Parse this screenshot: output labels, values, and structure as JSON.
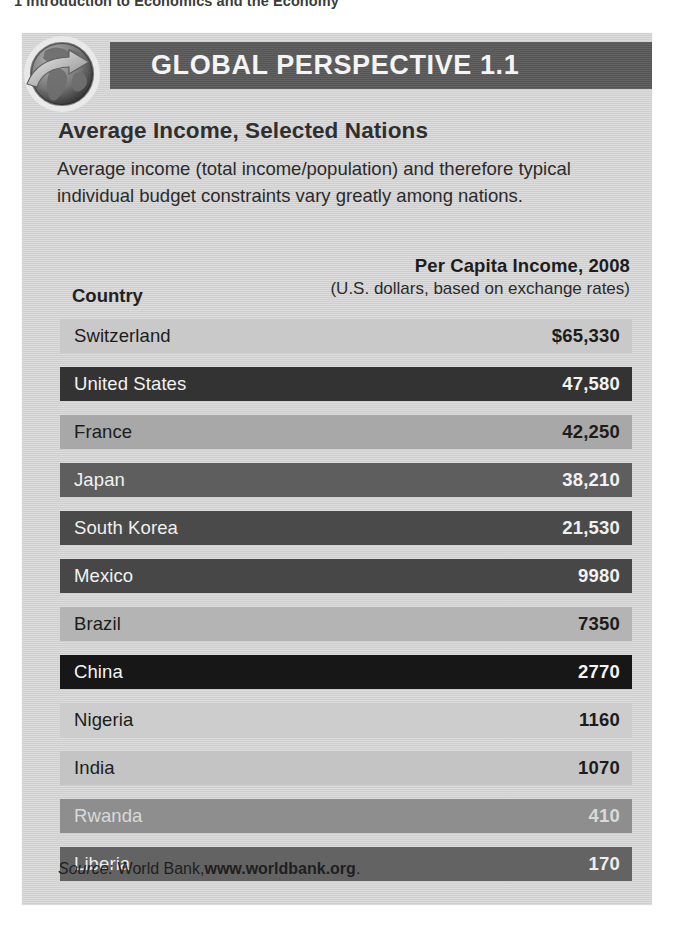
{
  "page": {
    "running_head": "1 Introduction to Economics and the Economy"
  },
  "panel": {
    "band_title": "GLOBAL PERSPECTIVE 1.1",
    "globe_icon": "globe-arrow-icon",
    "headline": "Average Income, Selected Nations",
    "intro": "Average income (total income/population) and therefore typical individual budget constraints vary greatly among nations.",
    "columns": {
      "country": "Country",
      "value_main": "Per Capita Income, 2008",
      "value_sub": "(U.S. dollars, based on exchange rates)"
    },
    "source": {
      "label": "Source:",
      "publisher": "World Bank,",
      "url": "www.worldbank.org",
      "period": "."
    }
  },
  "chart_data": {
    "type": "bar",
    "title": "Average Income, Selected Nations",
    "subtitle": "Per Capita Income, 2008 (U.S. dollars, based on exchange rates)",
    "xlabel": "Country",
    "ylabel": "Per Capita Income, 2008",
    "source": "World Bank, www.worldbank.org",
    "grid": false,
    "legend": "none",
    "orientation": "horizontal",
    "categories": [
      "Switzerland",
      "United States",
      "France",
      "Japan",
      "South Korea",
      "Mexico",
      "Brazil",
      "China",
      "Nigeria",
      "India",
      "Rwanda",
      "Liberia"
    ],
    "values": [
      65330,
      47580,
      42250,
      38210,
      21530,
      9980,
      7350,
      2770,
      1160,
      1070,
      410,
      170
    ],
    "value_labels": [
      "$65,330",
      "47,580",
      "42,250",
      "38,210",
      "21,530",
      "9980",
      "7350",
      "2770",
      "1160",
      "1070",
      "410",
      "170"
    ],
    "rows": [
      {
        "country": "Switzerland",
        "value": 65330,
        "label": "$65,330",
        "bar_color": "#c9c9c9",
        "text_color": "#1c1c1c"
      },
      {
        "country": "United States",
        "value": 47580,
        "label": "47,580",
        "bar_color": "#333333",
        "text_color": "#f2f2f2"
      },
      {
        "country": "France",
        "value": 42250,
        "label": "42,250",
        "bar_color": "#a8a8a8",
        "text_color": "#1c1c1c"
      },
      {
        "country": "Japan",
        "value": 38210,
        "label": "38,210",
        "bar_color": "#5e5e5e",
        "text_color": "#f2f2f2"
      },
      {
        "country": "South Korea",
        "value": 21530,
        "label": "21,530",
        "bar_color": "#4a4a4a",
        "text_color": "#efefef"
      },
      {
        "country": "Mexico",
        "value": 9980,
        "label": "9980",
        "bar_color": "#474747",
        "text_color": "#f2f2f2"
      },
      {
        "country": "Brazil",
        "value": 7350,
        "label": "7350",
        "bar_color": "#b4b4b4",
        "text_color": "#1c1c1c"
      },
      {
        "country": "China",
        "value": 2770,
        "label": "2770",
        "bar_color": "#171717",
        "text_color": "#f4f4f4"
      },
      {
        "country": "Nigeria",
        "value": 1160,
        "label": "1160",
        "bar_color": "#cdcdcd",
        "text_color": "#1c1c1c"
      },
      {
        "country": "India",
        "value": 1070,
        "label": "1070",
        "bar_color": "#c4c4c4",
        "text_color": "#1c1c1c"
      },
      {
        "country": "Rwanda",
        "value": 410,
        "label": "410",
        "bar_color": "#8e8e8e",
        "text_color": "#d9d9d9"
      },
      {
        "country": "Liberia",
        "value": 170,
        "label": "170",
        "bar_color": "#636363",
        "text_color": "#ededed"
      }
    ],
    "colors": {
      "panel_background": "#d2d2d2",
      "title_band": "#5a5a5a",
      "page_background": "#ffffff"
    }
  }
}
